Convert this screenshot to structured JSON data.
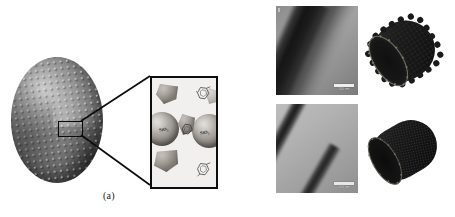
{
  "figure": {
    "type": "scientific-figure",
    "panels": [
      {
        "id": "a",
        "caption": "(a)",
        "description": "Schematic of a silica nanoparticle-decorated sphere with a magnified inset",
        "inset": {
          "sphere_labels": [
            "SiO2",
            "SiO2"
          ],
          "sphere_label_left": "SiO₂",
          "sphere_label_right": "SiO₂"
        }
      },
      {
        "id": "b",
        "caption": "(b)",
        "description": "TEM micrographs of nanotubes with corresponding 3D molecular models",
        "images": [
          {
            "position": "top-left",
            "kind": "tem-micrograph",
            "scale_bar": "100 nm"
          },
          {
            "position": "top-right",
            "kind": "3d-model",
            "model": "rough-walled nanotube"
          },
          {
            "position": "bottom-left",
            "kind": "tem-micrograph",
            "scale_bar": "100 nm"
          },
          {
            "position": "bottom-right",
            "kind": "3d-model",
            "model": "smooth lattice nanotube"
          }
        ]
      }
    ]
  },
  "colors": {
    "background": "#ffffff",
    "ink": "#0d0d0d",
    "sphere_dark": "#3d3d3d",
    "sphere_light": "#9a9a9a",
    "inset_bg": "#f2f0ee",
    "tem_gray_top": "#9a9a9a",
    "tem_gray_bottom": "#b4b4b4",
    "tube_dark": "#121212",
    "scalebar": "#efefef"
  }
}
